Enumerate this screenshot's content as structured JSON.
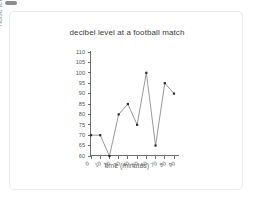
{
  "page": {
    "background": "#ffffff",
    "chip_color": "#8d8d8d"
  },
  "card": {
    "border_color": "#ececec",
    "background": "#ffffff"
  },
  "chart_data": {
    "type": "line",
    "title": "decibel level at a football match",
    "xlabel": "time (minutes)",
    "ylabel": "noise level (decibels)",
    "x": [
      0,
      10,
      20,
      30,
      40,
      50,
      60,
      70,
      80,
      90
    ],
    "values": [
      70,
      70,
      60,
      80,
      85,
      75,
      100,
      65,
      95,
      90
    ],
    "xticks": [
      "0",
      "10",
      "20",
      "30",
      "40",
      "50",
      "60",
      "70",
      "80",
      "90"
    ],
    "yticks": [
      "60",
      "65",
      "70",
      "75",
      "80",
      "85",
      "90",
      "95",
      "100",
      "105",
      "110"
    ],
    "xlim": [
      0,
      90
    ],
    "ylim": [
      60,
      110
    ],
    "grid": false,
    "legend": false,
    "marker": "square",
    "line_color": "#6b6b6b",
    "marker_color": "#2a2a2a",
    "axis_color": "#4a4a4a"
  }
}
